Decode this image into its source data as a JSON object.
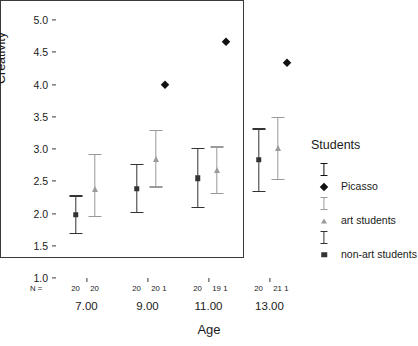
{
  "chart_data": {
    "type": "scatter",
    "title": "",
    "xlabel": "Age",
    "ylabel": "Creativity",
    "ylim": [
      1.0,
      5.0
    ],
    "ytick_step": 0.5,
    "yticks": [
      "1.0",
      "1.5",
      "2.0",
      "2.5",
      "3.0",
      "3.5",
      "4.0",
      "4.5",
      "5.0"
    ],
    "categories": [
      "7.00",
      "9.00",
      "11.00",
      "13.00"
    ],
    "grid": false,
    "legend_position": "right",
    "n_row_label": "N =",
    "series": [
      {
        "name": "non-art students",
        "marker": "square",
        "color": "#333333",
        "n": [
          20,
          20,
          20,
          20
        ],
        "values": [
          1.98,
          2.38,
          2.55,
          2.83
        ],
        "ci_low": [
          1.68,
          2.0,
          2.08,
          2.33
        ],
        "ci_high": [
          2.28,
          2.77,
          3.02,
          3.32
        ]
      },
      {
        "name": "art students",
        "marker": "triangle",
        "color": "#9a9a9a",
        "n": [
          20,
          20,
          19,
          21
        ],
        "values": [
          2.38,
          2.85,
          2.67,
          3.02
        ],
        "ci_low": [
          1.94,
          2.4,
          2.3,
          2.52
        ],
        "ci_high": [
          2.93,
          3.3,
          3.04,
          3.5
        ]
      },
      {
        "name": "Picasso",
        "marker": "diamond",
        "color": "#111111",
        "n": [
          null,
          1,
          1,
          1
        ],
        "values": [
          null,
          4.0,
          4.66,
          4.33
        ],
        "ci_low": [
          null,
          null,
          null,
          null
        ],
        "ci_high": [
          null,
          null,
          null,
          null
        ]
      }
    ]
  },
  "legend": {
    "title": "Students",
    "entries": [
      {
        "label": "Picasso",
        "marker": "diamond",
        "color": "#111111"
      },
      {
        "label": "art students",
        "marker": "triangle",
        "color": "#9a9a9a"
      },
      {
        "label": "non-art students",
        "marker": "square",
        "color": "#333333"
      }
    ]
  }
}
